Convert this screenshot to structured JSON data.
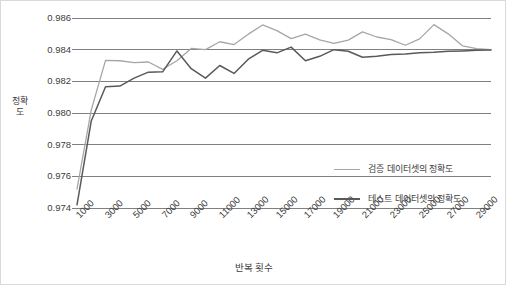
{
  "chart_data": {
    "type": "line",
    "title": "",
    "xlabel": "반복 횟수",
    "ylabel": "정확도",
    "xlim": [
      1000,
      30000
    ],
    "ylim": [
      0.974,
      0.986
    ],
    "ytick_values": [
      0.986,
      0.984,
      0.982,
      0.98,
      0.978,
      0.976,
      0.974
    ],
    "ytick_labels": [
      "0.986",
      "0.984",
      "0.982",
      "0.980",
      "0.978",
      "0.976",
      "0.974"
    ],
    "xtick_values": [
      1000,
      3000,
      5000,
      7000,
      9000,
      11000,
      13000,
      15000,
      17000,
      19000,
      21000,
      23000,
      25000,
      27000,
      29000
    ],
    "xtick_labels": [
      "1000",
      "3000",
      "5000",
      "7000",
      "9000",
      "11000",
      "13000",
      "15000",
      "17000",
      "19000",
      "21000",
      "23000",
      "25000",
      "27000",
      "29000"
    ],
    "grid": true,
    "grid_axis": "y",
    "legend_position": "inside-right",
    "x": [
      1000,
      2000,
      3000,
      4000,
      5000,
      6000,
      7000,
      8000,
      9000,
      10000,
      11000,
      12000,
      13000,
      14000,
      15000,
      16000,
      17000,
      18000,
      19000,
      20000,
      21000,
      22000,
      23000,
      24000,
      25000,
      26000,
      27000,
      28000,
      29000,
      30000
    ],
    "series": [
      {
        "name": "검증 데이터셋의 정확도",
        "color": "#a6a6a6",
        "width": 1.3,
        "values": [
          0.9752,
          0.9802,
          0.98332,
          0.9833,
          0.98318,
          0.98322,
          0.98276,
          0.9833,
          0.98408,
          0.984,
          0.9845,
          0.98432,
          0.98498,
          0.98556,
          0.9852,
          0.9847,
          0.98498,
          0.98462,
          0.9844,
          0.9846,
          0.98512,
          0.9848,
          0.98464,
          0.98428,
          0.98468,
          0.98558,
          0.985,
          0.98424,
          0.98406,
          0.984
        ]
      },
      {
        "name": "테스트 데이터셋의 정확도",
        "color": "#595959",
        "width": 1.5,
        "values": [
          0.9742,
          0.9795,
          0.98166,
          0.9817,
          0.9822,
          0.98258,
          0.9826,
          0.98392,
          0.9828,
          0.9822,
          0.983,
          0.9825,
          0.9834,
          0.98396,
          0.9838,
          0.98416,
          0.9833,
          0.98358,
          0.984,
          0.9839,
          0.98352,
          0.98358,
          0.9837,
          0.98372,
          0.9838,
          0.98384,
          0.9839,
          0.98392,
          0.98396,
          0.98398
        ]
      }
    ]
  },
  "legend": {
    "items": [
      {
        "label": "검증 데이터셋의 정확도",
        "color": "#a6a6a6",
        "thickness": 1.3
      },
      {
        "label": "테스트 데이터셋의 정확도",
        "color": "#595959",
        "thickness": 2
      }
    ]
  },
  "colors": {
    "background": "#ffffff",
    "border": "#d9d9d9",
    "gridline": "#808080",
    "text": "#404040",
    "validation_series": "#a6a6a6",
    "test_series": "#595959"
  }
}
